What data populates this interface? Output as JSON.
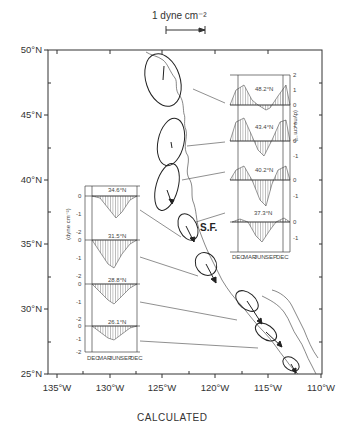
{
  "figure": {
    "title": "CALCULATED",
    "scale_bar_label": "1 dyne cm⁻²",
    "location_label": "S.F.",
    "y_axis_labels": [
      "50°N",
      "45°N",
      "40°N",
      "35°N",
      "30°N",
      "25°N"
    ],
    "x_axis_labels": [
      "135°W",
      "130°W",
      "125°W",
      "120°W",
      "115°W",
      "110°W"
    ],
    "inset_right": {
      "unit_label": "(dyne cm⁻²)",
      "y_ticks": [
        "2",
        "1",
        "0",
        "1",
        "0",
        "-1",
        "0",
        "-1",
        "0",
        "-1"
      ],
      "month_labels": [
        "DEC",
        "MAR",
        "JUN",
        "SEP",
        "DEC"
      ],
      "panels": [
        {
          "latitude": "48.2°N"
        },
        {
          "latitude": "43.4°N"
        },
        {
          "latitude": "40.2°N"
        },
        {
          "latitude": "37.3°N"
        }
      ]
    },
    "inset_left": {
      "unit_label": "(dyne cm⁻²)",
      "y_ticks": [
        "0",
        "-1",
        "-2"
      ],
      "month_labels": [
        "DEC",
        "MAR",
        "JUN",
        "SEP",
        "DEC"
      ],
      "panels": [
        {
          "latitude": "34.6°N"
        },
        {
          "latitude": "31.5°N"
        },
        {
          "latitude": "28.8°N"
        },
        {
          "latitude": "26.1°N"
        }
      ]
    }
  }
}
